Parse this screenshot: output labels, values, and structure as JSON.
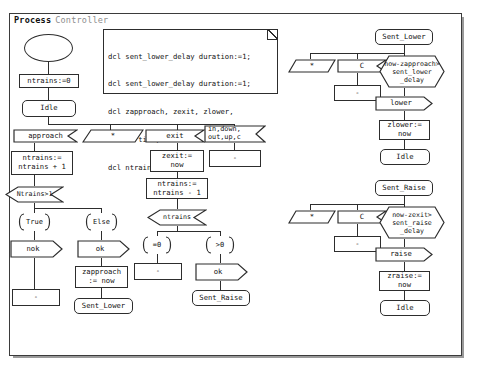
{
  "frame": {
    "keyword": "Process",
    "name": "Controller"
  },
  "declaration_text": {
    "lines": [
      "dcl sent_lower_delay duration:=1;",
      "dcl sent_lower_delay duration:=1;",
      "dcl zapproach, zexit, zlower,",
      "zraise time;",
      "dcl ntrains integer;"
    ]
  },
  "nodes": {
    "start": "",
    "init_task": "ntrains:=0",
    "state_idle_main": "Idle",
    "input_approach": "approach",
    "save_star_1": "*",
    "input_exit": "exit",
    "input_signals_misc": "in,down,\nout,up,c",
    "task_inc": "ntrains:=\nntrains + 1",
    "task_zexit": "zexit:=\nnow",
    "nextstate_dash_misc": "-",
    "task_dec": "ntrains:=\nntrains - 1",
    "decision_ntrains_gt1": "Ntrains>1",
    "branch_true": "True",
    "branch_else": "Else",
    "output_nok": "nok",
    "output_ok_left": "ok",
    "nextstate_dash_nok": "-",
    "task_zapproach": "zapproach\n:= now",
    "state_sent_lower_bottom": "Sent_Lower",
    "decision_ntrains": "ntrains",
    "branch_eq0": "=0",
    "branch_gt0": ">0",
    "nextstate_dash_eq0": "-",
    "output_ok_right": "ok",
    "state_sent_raise_bottom": "Sent_Raise",
    "state_sent_lower_top": "Sent_Lower",
    "save_star_2": "*",
    "input_c_1": "C",
    "nextstate_dash_c1": "-",
    "condition_lower": "now-zapproach>\nsent_lower\n_delay",
    "output_lower": "lower",
    "task_zlower": "zlower:=\nnow",
    "state_idle_lower": "Idle",
    "state_sent_raise_top": "Sent_Raise",
    "save_star_3": "*",
    "input_c_2": "C",
    "nextstate_dash_c2": "-",
    "condition_raise": "now-zexit>\nsent_raise\n_delay",
    "output_raise": "raise",
    "task_zraise": "zraise:=\nnow",
    "state_idle_raise": "Idle"
  },
  "colors": {
    "stroke": "#2d2d2d",
    "frame_stroke": "#3b3b3b",
    "title_keyword": "#111111",
    "title_name": "#8d8d8d",
    "background": "#ffffff"
  }
}
